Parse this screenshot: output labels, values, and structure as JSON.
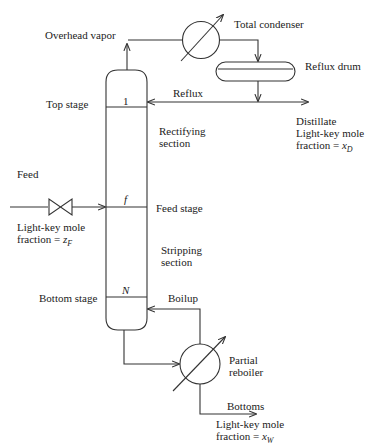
{
  "diagram": {
    "labels": {
      "overhead_vapor": "Overhead vapor",
      "total_condenser": "Total condenser",
      "reflux_drum": "Reflux drum",
      "reflux": "Reflux",
      "top_stage": "Top stage",
      "rectifying_section_1": "Rectifying",
      "rectifying_section_2": "section",
      "distillate_1": "Distillate",
      "distillate_2": "Light-key mole",
      "distillate_3_prefix": "fraction = ",
      "distillate_var": "x",
      "distillate_sub": "D",
      "feed": "Feed",
      "feed_comp_1": "Light-key mole",
      "feed_comp_2_prefix": "fraction = ",
      "feed_var": "z",
      "feed_sub": "F",
      "feed_stage": "Feed stage",
      "stripping_section_1": "Stripping",
      "stripping_section_2": "section",
      "bottom_stage": "Bottom stage",
      "boilup": "Boilup",
      "partial_reboiler_1": "Partial",
      "partial_reboiler_2": "reboiler",
      "bottoms": "Bottoms",
      "bottoms_comp_1": "Light-key mole",
      "bottoms_comp_2_prefix": "fraction = ",
      "bottoms_var": "x",
      "bottoms_sub": "W"
    },
    "stage_markers": {
      "top": "1",
      "feed": "f",
      "bottom": "N"
    },
    "colors": {
      "line": "#333333",
      "background": "#ffffff"
    }
  }
}
